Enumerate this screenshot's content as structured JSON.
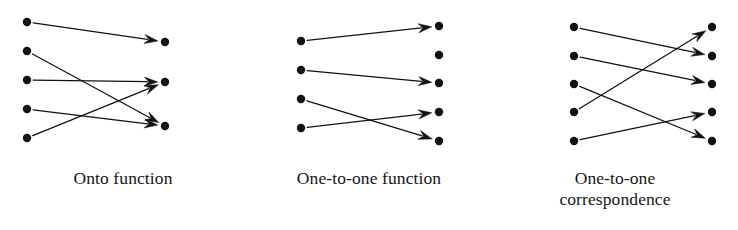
{
  "figure": {
    "background_color": "#ffffff",
    "ink_color": "#111111",
    "dot_radius": 4.2,
    "width": 738,
    "height": 230
  },
  "panels": [
    {
      "id": "onto",
      "caption_lines": [
        "Onto function"
      ],
      "left_dots": [
        {
          "label": "L1",
          "x": 27,
          "y": 22
        },
        {
          "label": "L2",
          "x": 27,
          "y": 51
        },
        {
          "label": "L3",
          "x": 27,
          "y": 80
        },
        {
          "label": "L4",
          "x": 27,
          "y": 109
        },
        {
          "label": "L5",
          "x": 27,
          "y": 138
        }
      ],
      "right_dots": [
        {
          "label": "R1",
          "x": 165,
          "y": 42
        },
        {
          "label": "R2",
          "x": 165,
          "y": 82
        },
        {
          "label": "R3",
          "x": 165,
          "y": 126
        }
      ],
      "arrows": [
        {
          "from": "L1",
          "to": "R1"
        },
        {
          "from": "L2",
          "to": "R3"
        },
        {
          "from": "L3",
          "to": "R2"
        },
        {
          "from": "L4",
          "to": "R3"
        },
        {
          "from": "L5",
          "to": "R2"
        }
      ]
    },
    {
      "id": "one-to-one",
      "caption_lines": [
        "One-to-one function"
      ],
      "left_dots": [
        {
          "label": "L1",
          "x": 55,
          "y": 41
        },
        {
          "label": "L2",
          "x": 55,
          "y": 70
        },
        {
          "label": "L3",
          "x": 55,
          "y": 99
        },
        {
          "label": "L4",
          "x": 55,
          "y": 128
        }
      ],
      "right_dots": [
        {
          "label": "R1",
          "x": 193,
          "y": 26
        },
        {
          "label": "R2",
          "x": 193,
          "y": 55
        },
        {
          "label": "R3",
          "x": 193,
          "y": 83
        },
        {
          "label": "R4",
          "x": 193,
          "y": 112
        },
        {
          "label": "R5",
          "x": 193,
          "y": 141
        }
      ],
      "arrows": [
        {
          "from": "L1",
          "to": "R1"
        },
        {
          "from": "L2",
          "to": "R3"
        },
        {
          "from": "L3",
          "to": "R5"
        },
        {
          "from": "L4",
          "to": "R4"
        }
      ]
    },
    {
      "id": "correspondence",
      "caption_lines": [
        "One-to-one",
        "correspondence"
      ],
      "left_dots": [
        {
          "label": "L1",
          "x": 82,
          "y": 27
        },
        {
          "label": "L2",
          "x": 82,
          "y": 56
        },
        {
          "label": "L3",
          "x": 82,
          "y": 84
        },
        {
          "label": "L4",
          "x": 82,
          "y": 112
        },
        {
          "label": "L5",
          "x": 82,
          "y": 141
        }
      ],
      "right_dots": [
        {
          "label": "R1",
          "x": 220,
          "y": 27
        },
        {
          "label": "R2",
          "x": 220,
          "y": 56
        },
        {
          "label": "R3",
          "x": 220,
          "y": 84
        },
        {
          "label": "R4",
          "x": 220,
          "y": 112
        },
        {
          "label": "R5",
          "x": 220,
          "y": 141
        }
      ],
      "arrows": [
        {
          "from": "L1",
          "to": "R2"
        },
        {
          "from": "L2",
          "to": "R3"
        },
        {
          "from": "L3",
          "to": "R5"
        },
        {
          "from": "L4",
          "to": "R1"
        },
        {
          "from": "L5",
          "to": "R4"
        }
      ]
    }
  ]
}
